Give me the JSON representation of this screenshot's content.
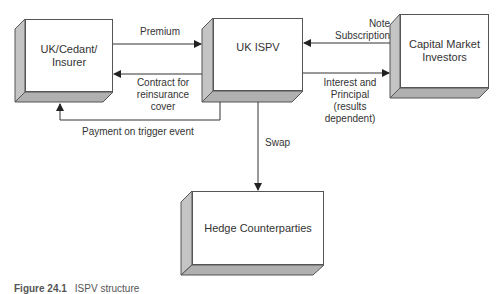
{
  "nodes": {
    "cedant": {
      "label_line1": "UK/Cedant/",
      "label_line2": "Insurer"
    },
    "ispv": {
      "label": "UK ISPV"
    },
    "investors": {
      "label_line1": "Capital Market",
      "label_line2": "Investors"
    },
    "hedge": {
      "label": "Hedge Counterparties"
    }
  },
  "edges": {
    "premium": {
      "label": "Premium",
      "from": "cedant",
      "to": "ispv"
    },
    "contract": {
      "line1": "Contract for",
      "line2": "reinsurance",
      "line3": "cover",
      "from": "ispv",
      "to": "cedant"
    },
    "payment": {
      "label": "Payment on trigger event",
      "from": "ispv",
      "to": "cedant"
    },
    "note": {
      "line1": "Note",
      "line2": "Subscription",
      "from": "investors",
      "to": "ispv"
    },
    "interest": {
      "line1": "Interest and",
      "line2": "Principal",
      "line3": "(results",
      "line4": "dependent)",
      "from": "ispv",
      "to": "investors"
    },
    "swap": {
      "label": "Swap",
      "from": "ispv",
      "to": "hedge"
    }
  },
  "caption": {
    "figure": "Figure 24.1",
    "text": "ISPV structure"
  },
  "colors": {
    "line": "#333333",
    "side_face": "#c4c4c4",
    "bottom_face": "#b0b0b0",
    "front_face": "#ffffff"
  }
}
